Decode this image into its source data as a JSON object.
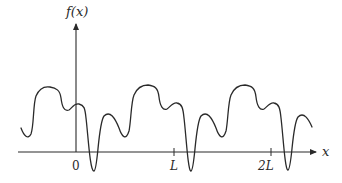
{
  "diagram": {
    "type": "periodic-function-plot",
    "y_axis_label": "f(x)",
    "x_axis_label": "x",
    "ticks": [
      {
        "label": "0",
        "position": 0
      },
      {
        "label": "L",
        "position": 1
      },
      {
        "label": "2L",
        "position": 2
      }
    ],
    "colors": {
      "line": "#2a2a2a",
      "background": "#ffffff"
    }
  }
}
